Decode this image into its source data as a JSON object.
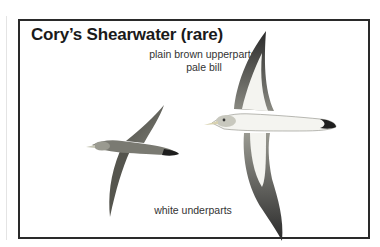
{
  "figure": {
    "title": "Cory’s Shearwater (rare)",
    "annotations": {
      "upperparts_line1": "plain brown upperparts,",
      "upperparts_line2": "pale bill",
      "underparts": "white underparts"
    },
    "illustrations": [
      {
        "name": "shearwater-upperside",
        "view": "dorsal"
      },
      {
        "name": "shearwater-underside",
        "view": "ventral"
      }
    ],
    "colors": {
      "frame": "#2a2a2a",
      "upperparts": "#6b6b63",
      "underparts": "#f4f4f0",
      "wingtips": "#1e1e1e"
    }
  }
}
